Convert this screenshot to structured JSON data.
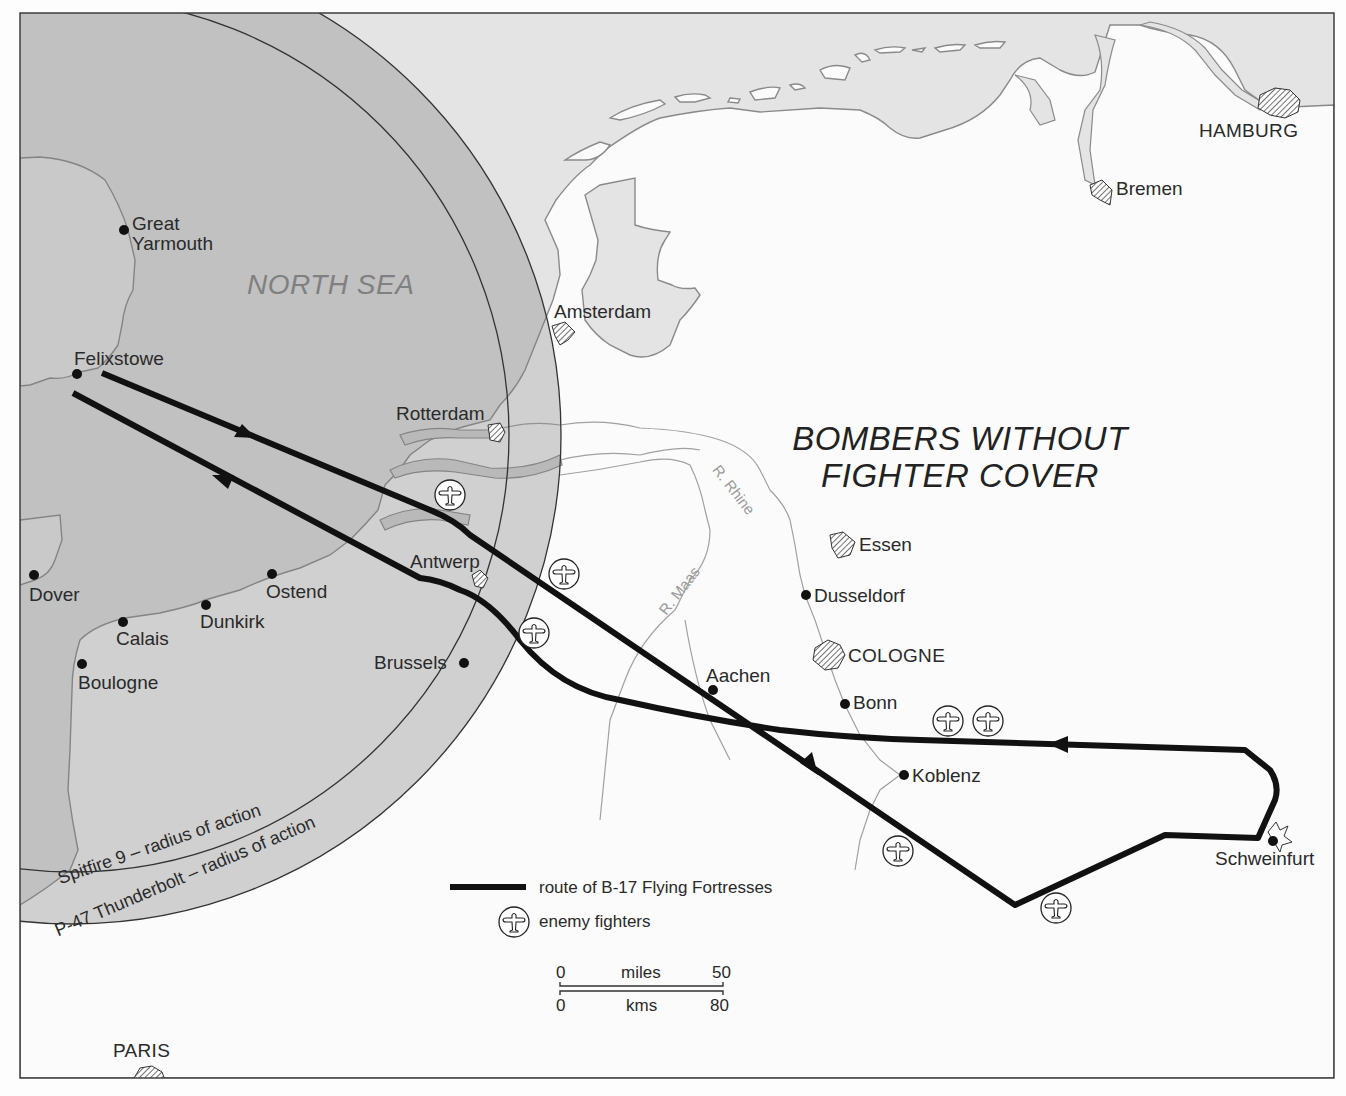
{
  "map": {
    "title_line1": "BOMBERS WITHOUT",
    "title_line2": "FIGHTER COVER",
    "sea_label": "NORTH SEA",
    "rivers": {
      "rhine": "R. Rhine",
      "maas": "R. Maas"
    },
    "radii": {
      "spitfire": "Spitfire 9 – radius of action",
      "p47": "P-47 Thunderbolt – radius of action"
    },
    "places": {
      "great_yarmouth_1": "Great",
      "great_yarmouth_2": "Yarmouth",
      "felixstowe": "Felixstowe",
      "dover": "Dover",
      "calais": "Calais",
      "boulogne": "Boulogne",
      "dunkirk": "Dunkirk",
      "ostend": "Ostend",
      "brussels": "Brussels",
      "antwerp": "Antwerp",
      "rotterdam": "Rotterdam",
      "amsterdam": "Amsterdam",
      "bremen": "Bremen",
      "hamburg": "HAMBURG",
      "essen": "Essen",
      "dusseldorf": "Dusseldorf",
      "cologne": "COLOGNE",
      "bonn": "Bonn",
      "aachen": "Aachen",
      "koblenz": "Koblenz",
      "schweinfurt": "Schweinfurt",
      "paris": "PARIS"
    }
  },
  "legend": {
    "route_label": "route of B-17 Flying Fortresses",
    "fighters_label": "enemy fighters"
  },
  "scale": {
    "miles_start": "0",
    "miles_unit": "miles",
    "miles_end": "50",
    "kms_start": "0",
    "kms_unit": "kms",
    "kms_end": "80"
  },
  "colors": {
    "sea": "#e3e3e3",
    "land": "#fbfbfb",
    "radius_overlay": "#bdbdbd",
    "route": "#111111",
    "coast": "#8a8a8a"
  }
}
